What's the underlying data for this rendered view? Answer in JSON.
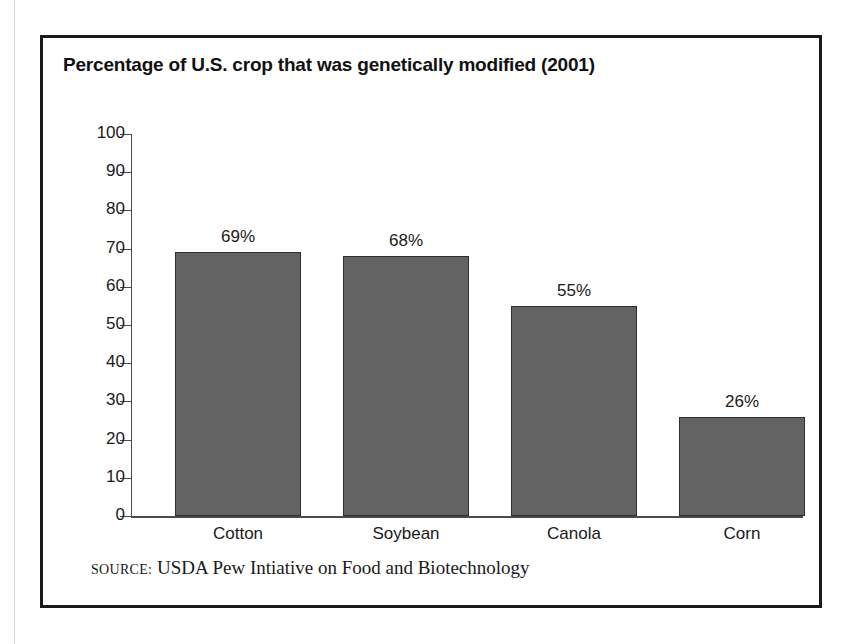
{
  "figure": {
    "title": "Percentage of U.S. crop that was genetically modified (2001)",
    "source_label": "SOURCE:",
    "source_text": "USDA Pew Intiative on Food and Biotechnology",
    "frame_color": "#1a1a1a",
    "background_color": "#ffffff"
  },
  "chart_data": {
    "type": "bar",
    "title": "Percentage of U.S. crop that was genetically modified (2001)",
    "subtitle": "",
    "xlabel": "",
    "ylabel": "",
    "categories": [
      "Cotton",
      "Soybean",
      "Canola",
      "Corn"
    ],
    "values": [
      69,
      68,
      55,
      26
    ],
    "value_labels": [
      "69%",
      "68%",
      "55%",
      "26%"
    ],
    "ylim": [
      0,
      100
    ],
    "ytick_labels": [
      "100",
      "90",
      "80",
      "70",
      "60",
      "50",
      "40",
      "30",
      "20",
      "10",
      "0"
    ],
    "ytick_values": [
      100,
      90,
      80,
      70,
      60,
      50,
      40,
      30,
      20,
      10,
      0
    ],
    "grid": false,
    "legend": false,
    "bar_color": "#636363",
    "bar_edge_color": "#2e2e2e",
    "axis_color": "#4a4a4a"
  }
}
